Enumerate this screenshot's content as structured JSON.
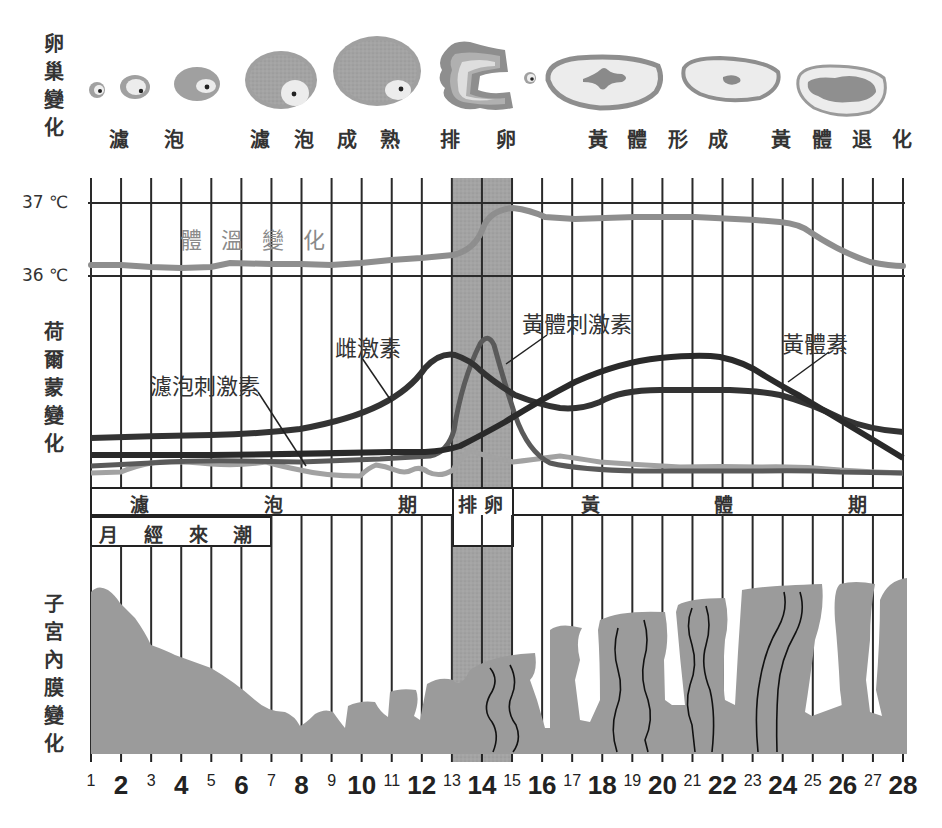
{
  "sections": {
    "ovary": {
      "label_chars": [
        "卵",
        "巢",
        "變",
        "化"
      ]
    },
    "hormone": {
      "label_chars": [
        "荷",
        "爾",
        "蒙",
        "變",
        "化"
      ]
    },
    "endometrium": {
      "label_chars": [
        "子",
        "宮",
        "內",
        "膜",
        "變",
        "化"
      ]
    }
  },
  "ovary_stages": [
    {
      "id": "follicle",
      "chars": [
        "濾",
        "泡"
      ]
    },
    {
      "id": "follicle-mature",
      "chars": [
        "濾",
        "泡",
        "成",
        "熟"
      ]
    },
    {
      "id": "ovulation",
      "chars": [
        "排",
        "卵"
      ]
    },
    {
      "id": "corpus-luteum-forming",
      "chars": [
        "黃",
        "體",
        "形",
        "成"
      ]
    },
    {
      "id": "corpus-luteum-regressing",
      "chars": [
        "黃",
        "體",
        "退",
        "化"
      ]
    }
  ],
  "temperature": {
    "label": "體 溫 變 化",
    "ticks": [
      "37 ℃",
      "36 ℃"
    ]
  },
  "hormone_labels": {
    "estrogen": "雌激素",
    "fsh": "濾泡刺激素",
    "lh": "黃體刺激素",
    "progesterone": "黃體素"
  },
  "phases": {
    "follicular": [
      "濾",
      "泡",
      "期"
    ],
    "ovulation": "排 卵",
    "luteal": [
      "黃",
      "體",
      "期"
    ],
    "menstruation": [
      "月",
      "經",
      "來",
      "潮"
    ]
  },
  "days": [
    "1",
    "2",
    "3",
    "4",
    "5",
    "6",
    "7",
    "8",
    "9",
    "10",
    "11",
    "12",
    "13",
    "14",
    "15",
    "16",
    "17",
    "18",
    "19",
    "20",
    "21",
    "22",
    "23",
    "24",
    "25",
    "26",
    "27",
    "28"
  ],
  "colors": {
    "grid": "#2a2a2a",
    "ovulation_band": "#9a9a9a",
    "temperature_line": "#8e8e8e",
    "estrogen": "#333333",
    "progesterone": "#2e2e2e",
    "lh": "#5a5a5a",
    "fsh": "#9c9c9c",
    "endometrium": "#9b9b9b"
  },
  "chart_data": {
    "type": "line",
    "xlabel": "day",
    "x": [
      1,
      2,
      3,
      4,
      5,
      6,
      7,
      8,
      9,
      10,
      11,
      12,
      13,
      14,
      15,
      16,
      17,
      18,
      19,
      20,
      21,
      22,
      23,
      24,
      25,
      26,
      27,
      28
    ],
    "temperature": {
      "ylim": [
        36,
        37
      ],
      "ticks": [
        "36℃",
        "37℃"
      ],
      "values": [
        36.15,
        36.15,
        36.12,
        36.12,
        36.15,
        36.17,
        36.17,
        36.17,
        36.17,
        36.17,
        36.22,
        36.25,
        36.27,
        36.55,
        36.9,
        36.85,
        36.8,
        36.8,
        36.8,
        36.8,
        36.8,
        36.8,
        36.78,
        36.77,
        36.75,
        36.55,
        36.3,
        36.2
      ]
    },
    "series": [
      {
        "name": "雌激素",
        "values": [
          20,
          20,
          20,
          20,
          21,
          22,
          24,
          28,
          33,
          42,
          58,
          80,
          88,
          80,
          66,
          56,
          52,
          52,
          54,
          54,
          54,
          52,
          48,
          40,
          33,
          25,
          20,
          14
        ]
      },
      {
        "name": "黃體刺激素",
        "values": [
          8,
          8,
          9,
          9,
          10,
          10,
          10,
          10,
          10,
          10,
          10,
          10,
          28,
          98,
          40,
          8,
          5,
          4,
          4,
          4,
          4,
          4,
          4,
          4,
          3,
          3,
          3,
          3
        ]
      },
      {
        "name": "黃體素",
        "values": [
          11,
          11,
          11,
          11,
          11,
          11,
          12,
          12,
          12,
          13,
          13,
          14,
          18,
          28,
          38,
          50,
          60,
          68,
          74,
          77,
          78,
          76,
          68,
          56,
          44,
          32,
          22,
          8
        ]
      },
      {
        "name": "濾泡刺激素",
        "values": [
          4,
          5,
          7,
          9,
          10,
          10,
          10,
          10,
          7,
          5,
          5,
          5,
          5,
          12,
          8,
          13,
          10,
          8,
          7,
          6,
          6,
          6,
          5,
          5,
          4,
          4,
          4,
          4
        ]
      }
    ],
    "annotations": [
      "濾泡期 (days 1-13)",
      "排卵 (days 13-15)",
      "黃體期 (days 15-28)",
      "月經來潮 (days 1-7)"
    ]
  }
}
